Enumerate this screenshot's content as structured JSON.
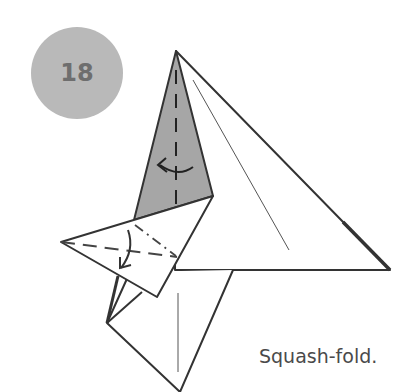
{
  "step": {
    "number": "18"
  },
  "caption": "Squash-fold.",
  "colors": {
    "step_circle": "#b9b9b9",
    "step_text": "#6e6e6e",
    "shaded_flap": "#a6a6a6",
    "line": "#333333",
    "caption_text": "#4a4a4a"
  }
}
